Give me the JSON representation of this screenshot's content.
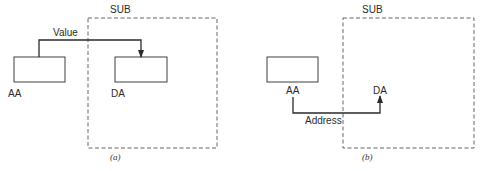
{
  "panels": [
    {
      "id": "a",
      "caption": "(a)",
      "container_label": "SUB",
      "source_label": "AA",
      "dest_label": "DA",
      "arrow_label": "Value",
      "dest_has_box": true
    },
    {
      "id": "b",
      "caption": "(b)",
      "container_label": "SUB",
      "source_label": "AA",
      "dest_label": "DA",
      "arrow_label": "Address",
      "dest_has_box": false
    }
  ],
  "colors": {
    "stroke": "#2a2a2a",
    "dashed": "#555555",
    "background": "#ffffff"
  }
}
